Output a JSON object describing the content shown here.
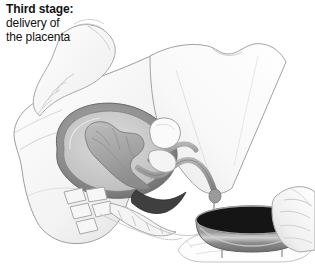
{
  "illustration": {
    "title_line1": "Third stage:",
    "title_line2": "delivery of",
    "title_line3": "the placenta",
    "subject": "childbirth-third-stage-delivery-of-placenta",
    "style": "grayscale-medical-line-drawing",
    "colors": {
      "background": "#ffffff",
      "text": "#111111",
      "outline": "#8d8d8d",
      "skin_light": "#f4f4f4",
      "skin_shade": "#e3e3e3",
      "thigh": "#fbfbfb",
      "uterus_wall": "#8b8b8b",
      "uterus_cavity": "#c9c9c9",
      "placenta": "#a6a6a6",
      "cord": "#9a9a9a",
      "birth_canal": "#4a4a4a",
      "bone": "#f2f2f2",
      "bowl_body": "#8e8e8e",
      "bowl_interior": "#151515",
      "cloth": "#fdfdfd"
    },
    "parts": [
      {
        "name": "attendant-upper-hand",
        "label": "attendant hand pressing abdomen"
      },
      {
        "name": "maternal-torso",
        "label": "maternal abdomen and torso"
      },
      {
        "name": "maternal-thigh",
        "label": "maternal thigh"
      },
      {
        "name": "uterus",
        "label": "uterus"
      },
      {
        "name": "placenta",
        "label": "placenta"
      },
      {
        "name": "umbilical-cord",
        "label": "umbilical cord"
      },
      {
        "name": "birth-canal",
        "label": "birth canal / vagina"
      },
      {
        "name": "bladder",
        "label": "bladder"
      },
      {
        "name": "spine-vertebrae",
        "label": "lumbar vertebrae"
      },
      {
        "name": "sacrum",
        "label": "sacrum"
      },
      {
        "name": "pubic-bone",
        "label": "pubic bone"
      },
      {
        "name": "collection-bowl",
        "label": "collection bowl"
      },
      {
        "name": "attendant-lower-hand",
        "label": "attendant hand holding bowl"
      },
      {
        "name": "cloth-drape",
        "label": "cloth drape"
      },
      {
        "name": "blood-drip",
        "label": "blood drip into bowl"
      }
    ]
  }
}
